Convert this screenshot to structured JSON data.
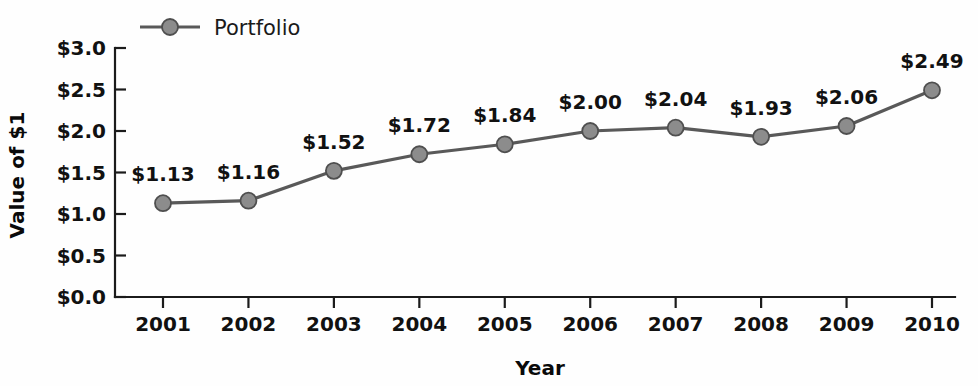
{
  "chart_data": {
    "type": "line",
    "title": "",
    "xlabel": "Year",
    "ylabel": "Value of $1",
    "categories": [
      "2001",
      "2002",
      "2003",
      "2004",
      "2005",
      "2006",
      "2007",
      "2008",
      "2009",
      "2010"
    ],
    "series": [
      {
        "name": "Portfolio",
        "values": [
          1.13,
          1.16,
          1.52,
          1.72,
          1.84,
          2.0,
          2.04,
          1.93,
          2.06,
          2.49
        ],
        "point_labels": [
          "$1.13",
          "$1.16",
          "$1.52",
          "$1.72",
          "$1.84",
          "$2.00",
          "$2.04",
          "$1.93",
          "$2.06",
          "$2.49"
        ],
        "color": "#595959",
        "marker_color": "#8c8c8c"
      }
    ],
    "ylim": [
      0.0,
      3.0
    ],
    "ytick_values": [
      0.0,
      0.5,
      1.0,
      1.5,
      2.0,
      2.5,
      3.0
    ],
    "ytick_labels": [
      "$0.0",
      "$0.5",
      "$1.0",
      "$1.5",
      "$2.0",
      "$2.5",
      "$3.0"
    ],
    "grid": false,
    "legend_position": "top-left",
    "legend_entries": [
      "Portfolio"
    ]
  },
  "axes": {
    "x_title": "Year",
    "y_title": "Value of $1"
  },
  "legend": {
    "portfolio_label": "Portfolio"
  },
  "colors": {
    "line": "#595959",
    "marker_fill": "#8c8c8c",
    "marker_stroke": "#4f4f4f",
    "axis": "#1b1b1b",
    "text": "#111111",
    "background": "#fefefe"
  }
}
